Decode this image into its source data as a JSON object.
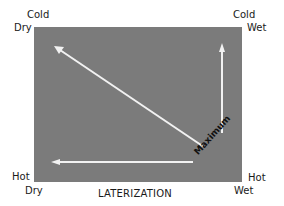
{
  "corners": {
    "top_left": {
      "line1": "Cold",
      "line2": "Dry"
    },
    "top_right": {
      "line1": "Cold",
      "line2": "Wet"
    },
    "bottom_left": {
      "line1": "Hot",
      "line2": "Dry"
    },
    "bottom_right": {
      "line1": "Hot",
      "line2": "Wet"
    }
  },
  "title": "LATERIZATION",
  "maximum_label": "Maximum",
  "colors": {
    "panel": "#7b7b7b",
    "arrow": "#f2f2f2",
    "text": "#1a1a1a"
  },
  "arrows": [
    {
      "name": "diagonal-arrow",
      "from": "Hot Wet",
      "to": "Cold Dry"
    },
    {
      "name": "vertical-arrow",
      "from": "Hot Wet",
      "to": "Cold Wet"
    },
    {
      "name": "horizontal-arrow",
      "from": "Hot Wet",
      "to": "Hot Dry"
    }
  ]
}
